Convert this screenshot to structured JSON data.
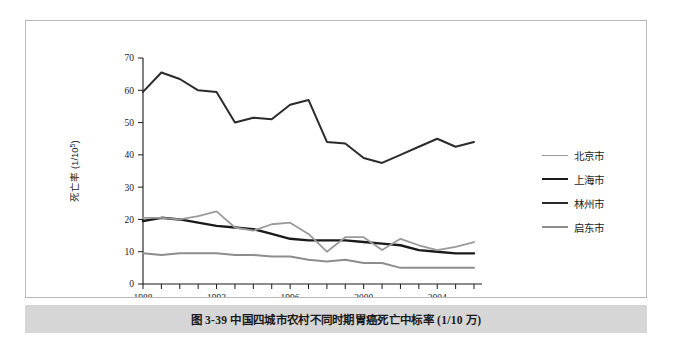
{
  "figure": {
    "caption": "图 3-39   中国四城市农村不同时期胃癌死亡中标率 (1/10 万)"
  },
  "legend": {
    "items": [
      {
        "label": "北京市",
        "color": "#9a9a9a",
        "width": 1.8
      },
      {
        "label": "上海市",
        "color": "#1a1a1a",
        "width": 2.4
      },
      {
        "label": "林州市",
        "color": "#2b2b2b",
        "width": 2.0
      },
      {
        "label": "启东市",
        "color": "#8d8d8d",
        "width": 2.0
      }
    ]
  },
  "chart_data": {
    "type": "line",
    "title": "",
    "xlabel": "年份",
    "ylabel": "死亡率 (1/10⁵)",
    "ylabel_base": "死亡率 (1/10",
    "ylabel_exp": "5",
    "ylabel_tail": ")",
    "xlim": [
      1988,
      2006
    ],
    "ylim": [
      0,
      70
    ],
    "yticks": [
      0,
      10,
      20,
      30,
      40,
      50,
      60,
      70
    ],
    "xticks_major": [
      1988,
      1992,
      1996,
      2000,
      2004
    ],
    "xticks_all": [
      1988,
      1989,
      1990,
      1991,
      1992,
      1993,
      1994,
      1995,
      1996,
      1997,
      1998,
      1999,
      2000,
      2001,
      2002,
      2003,
      2004,
      2005,
      2006
    ],
    "grid": false,
    "legend_position": "right",
    "x": [
      1988,
      1989,
      1990,
      1991,
      1992,
      1993,
      1994,
      1995,
      1996,
      1997,
      1998,
      1999,
      2000,
      2001,
      2002,
      2003,
      2004,
      2005,
      2006
    ],
    "series": [
      {
        "name": "林州市",
        "color": "#2b2b2b",
        "width": 2.0,
        "values": [
          59.5,
          65.5,
          63.5,
          60.0,
          59.5,
          50.0,
          51.5,
          51.0,
          55.5,
          57.0,
          44.0,
          43.5,
          39.0,
          37.5,
          40.0,
          42.5,
          45.0,
          42.5,
          44.0
        ]
      },
      {
        "name": "上海市",
        "color": "#1a1a1a",
        "width": 2.4,
        "values": [
          19.5,
          20.5,
          20.0,
          19.0,
          18.0,
          17.5,
          17.0,
          15.5,
          14.0,
          13.5,
          13.5,
          13.5,
          13.0,
          12.5,
          12.0,
          10.5,
          10.0,
          9.5,
          9.5
        ]
      },
      {
        "name": "北京市",
        "color": "#9a9a9a",
        "width": 1.8,
        "values": [
          20.5,
          20.5,
          20.0,
          21.0,
          22.5,
          17.5,
          16.5,
          18.5,
          19.0,
          15.5,
          10.0,
          14.5,
          14.5,
          10.5,
          14.0,
          12.0,
          10.5,
          11.5,
          13.0
        ]
      },
      {
        "name": "启东市",
        "color": "#8d8d8d",
        "width": 2.0,
        "values": [
          9.5,
          9.0,
          9.5,
          9.5,
          9.5,
          9.0,
          9.0,
          8.5,
          8.5,
          7.5,
          7.0,
          7.5,
          6.5,
          6.5,
          5.0,
          5.0,
          5.0,
          5.0,
          5.0
        ]
      }
    ]
  }
}
